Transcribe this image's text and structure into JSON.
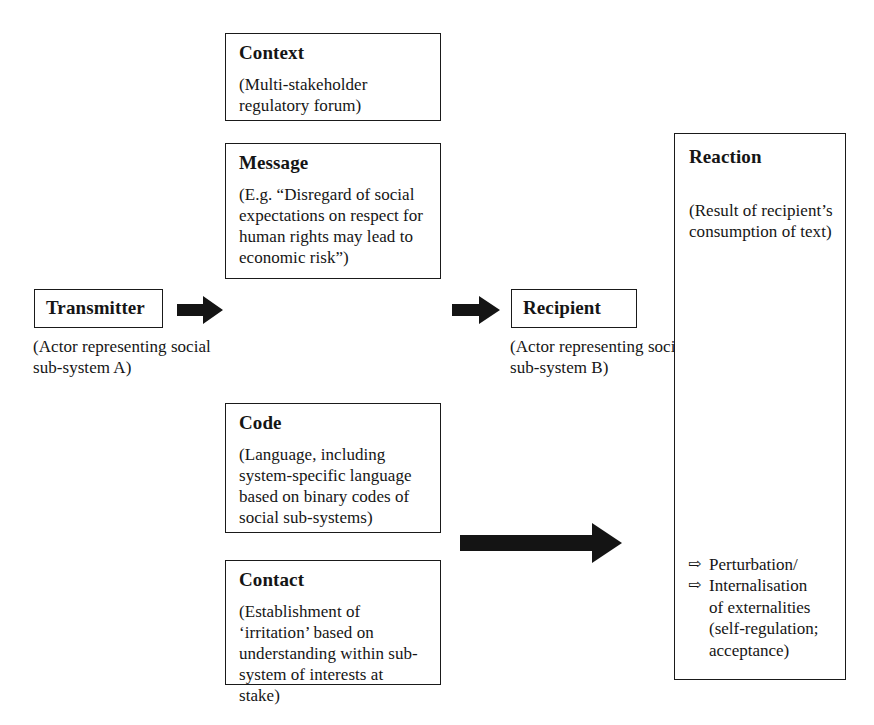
{
  "diagram": {
    "nodes": {
      "context": {
        "title": "Context",
        "body": "(Multi-stakeholder regulatory forum)"
      },
      "message": {
        "title": "Message",
        "body": "(E.g. “Disregard of social expectations on respect for human rights may lead to economic risk”)"
      },
      "transmitter": {
        "title": "Transmitter",
        "caption": "(Actor representing social sub-system A)"
      },
      "recipient": {
        "title": "Recipient",
        "caption": "(Actor representing social sub-system B)"
      },
      "code": {
        "title": "Code",
        "body": "(Language, including system-specific language based on binary codes of social sub-systems)"
      },
      "contact": {
        "title": "Contact",
        "body": "(Establishment of ‘irritation’ based on understanding within sub-system of interests at stake)"
      },
      "reaction": {
        "title": "Reaction",
        "body": "(Result of recipient’s consumption of text)",
        "bullet_marker": "⇨",
        "bullets": [
          "Perturbation/",
          "Internalisation"
        ],
        "bullets_continuation": "of externalities (self-regulation; acceptance)"
      }
    },
    "arrows": {
      "transmitter_to_message": "solid-block-arrow-right",
      "message_to_recipient": "solid-block-arrow-right",
      "contact_to_reaction": "long-solid-block-arrow-right"
    },
    "colors": {
      "stroke": "#1a1a1a",
      "text": "#151515",
      "background": "#ffffff"
    }
  }
}
